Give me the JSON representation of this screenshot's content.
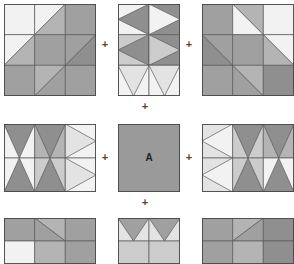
{
  "figure": {
    "background_color": "#ffffff",
    "outline_color": "#4a4a4a",
    "operator_symbol": "+",
    "operator_color": "#4a4a4a",
    "center_label": "A",
    "center_label_color": "#222222"
  },
  "palette": {
    "white": "#f7f7f7",
    "near_white": "#f2f2f2",
    "light": "#e3e3e3",
    "light_mid": "#cccccc",
    "mid": "#b4b4b4",
    "mid_dark": "#a0a0a0",
    "dark": "#8f8f8f",
    "darker": "#858585",
    "plain": "#9a9a9a",
    "stroke": "#5a5a5a"
  },
  "operators": [
    {
      "name": "plus-top-left-center",
      "symbol": "+",
      "x": 105,
      "y": 45
    },
    {
      "name": "plus-top-center-right",
      "symbol": "+",
      "x": 189,
      "y": 45
    },
    {
      "name": "plus-row1-row2",
      "symbol": "+",
      "x": 145,
      "y": 107
    },
    {
      "name": "plus-mid-left-center",
      "symbol": "+",
      "x": 105,
      "y": 158
    },
    {
      "name": "plus-mid-center-right",
      "symbol": "+",
      "x": 189,
      "y": 158
    },
    {
      "name": "plus-row2-row3",
      "symbol": "+",
      "x": 145,
      "y": 203
    }
  ],
  "blocks": [
    {
      "name": "block-top-left",
      "position": "top-left",
      "x": 4,
      "y": 4,
      "w": 92,
      "h": 92,
      "grid_cols": 3,
      "grid_rows": 3,
      "pattern": "diagonal-sash-descending",
      "cells": [
        {
          "r": 0,
          "c": 0,
          "type": "solid",
          "fill": "#f2f2f2"
        },
        {
          "r": 0,
          "c": 1,
          "type": "diag-tl-br",
          "fill_a": "#f2f2f2",
          "fill_b": "#b4b4b4"
        },
        {
          "r": 0,
          "c": 2,
          "type": "solid",
          "fill": "#a0a0a0"
        },
        {
          "r": 1,
          "c": 0,
          "type": "diag-tl-br",
          "fill_a": "#f2f2f2",
          "fill_b": "#b4b4b4"
        },
        {
          "r": 1,
          "c": 1,
          "type": "solid",
          "fill": "#a0a0a0"
        },
        {
          "r": 1,
          "c": 2,
          "type": "diag-tl-br",
          "fill_a": "#a0a0a0",
          "fill_b": "#8f8f8f"
        },
        {
          "r": 2,
          "c": 0,
          "type": "solid",
          "fill": "#a0a0a0"
        },
        {
          "r": 2,
          "c": 1,
          "type": "diag-tl-br",
          "fill_a": "#b4b4b4",
          "fill_b": "#a0a0a0"
        },
        {
          "r": 2,
          "c": 2,
          "type": "solid",
          "fill": "#a0a0a0"
        }
      ]
    },
    {
      "name": "block-top-center",
      "position": "top-center",
      "x": 118,
      "y": 4,
      "w": 62,
      "h": 92,
      "grid_cols": 2,
      "grid_rows": 3,
      "pattern": "hourglass-stack",
      "cells": [
        {
          "r": 0,
          "c": 0,
          "type": "tri-right",
          "fill_a": "#8f8f8f",
          "fill_b": "#f2f2f2"
        },
        {
          "r": 0,
          "c": 1,
          "type": "tri-left",
          "fill_a": "#f2f2f2",
          "fill_b": "#8f8f8f"
        },
        {
          "r": 1,
          "c": 0,
          "type": "tri-right",
          "fill_a": "#8f8f8f",
          "fill_b": "#cccccc"
        },
        {
          "r": 1,
          "c": 1,
          "type": "tri-left",
          "fill_a": "#cccccc",
          "fill_b": "#8f8f8f"
        },
        {
          "r": 2,
          "c": 0,
          "type": "tri-down",
          "fill_a": "#e3e3e3",
          "fill_b": "#f2f2f2"
        },
        {
          "r": 2,
          "c": 1,
          "type": "tri-down",
          "fill_a": "#e3e3e3",
          "fill_b": "#f2f2f2"
        }
      ]
    },
    {
      "name": "block-top-right",
      "position": "top-right",
      "x": 202,
      "y": 4,
      "w": 92,
      "h": 92,
      "grid_cols": 3,
      "grid_rows": 3,
      "pattern": "diagonal-sash-ascending",
      "cells": [
        {
          "r": 0,
          "c": 0,
          "type": "solid",
          "fill": "#a0a0a0"
        },
        {
          "r": 0,
          "c": 1,
          "type": "diag-bl-tr",
          "fill_a": "#f2f2f2",
          "fill_b": "#b4b4b4"
        },
        {
          "r": 0,
          "c": 2,
          "type": "solid",
          "fill": "#f2f2f2"
        },
        {
          "r": 1,
          "c": 0,
          "type": "diag-bl-tr",
          "fill_a": "#8f8f8f",
          "fill_b": "#a0a0a0"
        },
        {
          "r": 1,
          "c": 1,
          "type": "solid",
          "fill": "#a0a0a0"
        },
        {
          "r": 1,
          "c": 2,
          "type": "diag-bl-tr",
          "fill_a": "#b4b4b4",
          "fill_b": "#f2f2f2"
        },
        {
          "r": 2,
          "c": 0,
          "type": "solid",
          "fill": "#a0a0a0"
        },
        {
          "r": 2,
          "c": 1,
          "type": "diag-bl-tr",
          "fill_a": "#a0a0a0",
          "fill_b": "#b4b4b4"
        },
        {
          "r": 2,
          "c": 2,
          "type": "solid",
          "fill": "#8f8f8f"
        }
      ]
    },
    {
      "name": "block-middle-left",
      "position": "middle-left",
      "x": 4,
      "y": 124,
      "w": 92,
      "h": 68,
      "grid_cols": 3,
      "grid_rows": 2,
      "pattern": "hourglass-row",
      "cells": [
        {
          "r": 0,
          "c": 0,
          "type": "tri-down",
          "fill_a": "#8f8f8f",
          "fill_b": "#f2f2f2"
        },
        {
          "r": 0,
          "c": 1,
          "type": "tri-down",
          "fill_a": "#8f8f8f",
          "fill_b": "#b4b4b4"
        },
        {
          "r": 0,
          "c": 2,
          "type": "tri-left",
          "fill_a": "#e3e3e3",
          "fill_b": "#f2f2f2"
        },
        {
          "r": 1,
          "c": 0,
          "type": "tri-up",
          "fill_a": "#8f8f8f",
          "fill_b": "#f2f2f2"
        },
        {
          "r": 1,
          "c": 1,
          "type": "tri-up",
          "fill_a": "#8f8f8f",
          "fill_b": "#cccccc"
        },
        {
          "r": 1,
          "c": 2,
          "type": "tri-left",
          "fill_a": "#e3e3e3",
          "fill_b": "#f2f2f2"
        }
      ]
    },
    {
      "name": "block-center-plain",
      "position": "center",
      "x": 118,
      "y": 124,
      "w": 62,
      "h": 68,
      "grid_cols": 1,
      "grid_rows": 1,
      "pattern": "plain-labelled",
      "label": "A",
      "cells": [
        {
          "r": 0,
          "c": 0,
          "type": "solid",
          "fill": "#9a9a9a"
        }
      ]
    },
    {
      "name": "block-middle-right",
      "position": "middle-right",
      "x": 202,
      "y": 124,
      "w": 92,
      "h": 68,
      "grid_cols": 3,
      "grid_rows": 2,
      "pattern": "hourglass-row-mirrored",
      "cells": [
        {
          "r": 0,
          "c": 0,
          "type": "tri-right",
          "fill_a": "#f2f2f2",
          "fill_b": "#e3e3e3"
        },
        {
          "r": 0,
          "c": 1,
          "type": "tri-down",
          "fill_a": "#8f8f8f",
          "fill_b": "#cccccc"
        },
        {
          "r": 0,
          "c": 2,
          "type": "tri-down",
          "fill_a": "#8f8f8f",
          "fill_b": "#b4b4b4"
        },
        {
          "r": 1,
          "c": 0,
          "type": "tri-right",
          "fill_a": "#f2f2f2",
          "fill_b": "#e3e3e3"
        },
        {
          "r": 1,
          "c": 1,
          "type": "tri-up",
          "fill_a": "#8f8f8f",
          "fill_b": "#cccccc"
        },
        {
          "r": 1,
          "c": 2,
          "type": "tri-up",
          "fill_a": "#8f8f8f",
          "fill_b": "#f2f2f2"
        }
      ]
    },
    {
      "name": "block-bottom-left",
      "position": "bottom-left",
      "x": 4,
      "y": 218,
      "w": 92,
      "h": 46,
      "grid_cols": 3,
      "grid_rows": 2,
      "clipped": true,
      "pattern": "diagonal-sash-ascending-partial",
      "cells": [
        {
          "r": 0,
          "c": 0,
          "type": "solid",
          "fill": "#a0a0a0"
        },
        {
          "r": 0,
          "c": 1,
          "type": "diag-bl-tr",
          "fill_a": "#a0a0a0",
          "fill_b": "#b4b4b4"
        },
        {
          "r": 0,
          "c": 2,
          "type": "solid",
          "fill": "#a0a0a0"
        },
        {
          "r": 1,
          "c": 0,
          "type": "solid",
          "fill": "#f2f2f2"
        },
        {
          "r": 1,
          "c": 1,
          "type": "solid",
          "fill": "#b4b4b4"
        },
        {
          "r": 1,
          "c": 2,
          "type": "solid",
          "fill": "#a0a0a0"
        }
      ]
    },
    {
      "name": "block-bottom-center",
      "position": "bottom-center",
      "x": 118,
      "y": 218,
      "w": 62,
      "h": 46,
      "grid_cols": 2,
      "grid_rows": 2,
      "clipped": true,
      "pattern": "tri-down-pair-partial",
      "cells": [
        {
          "r": 0,
          "c": 0,
          "type": "tri-down",
          "fill_a": "#a0a0a0",
          "fill_b": "#e3e3e3"
        },
        {
          "r": 0,
          "c": 1,
          "type": "tri-down",
          "fill_a": "#a0a0a0",
          "fill_b": "#e3e3e3"
        },
        {
          "r": 1,
          "c": 0,
          "type": "solid",
          "fill": "#cccccc"
        },
        {
          "r": 1,
          "c": 1,
          "type": "solid",
          "fill": "#cccccc"
        }
      ]
    },
    {
      "name": "block-bottom-right",
      "position": "bottom-right",
      "x": 202,
      "y": 218,
      "w": 92,
      "h": 46,
      "grid_cols": 3,
      "grid_rows": 2,
      "clipped": true,
      "pattern": "diagonal-sash-descending-partial",
      "cells": [
        {
          "r": 0,
          "c": 0,
          "type": "solid",
          "fill": "#a0a0a0"
        },
        {
          "r": 0,
          "c": 1,
          "type": "diag-tl-br",
          "fill_a": "#b4b4b4",
          "fill_b": "#a0a0a0"
        },
        {
          "r": 0,
          "c": 2,
          "type": "solid",
          "fill": "#8f8f8f"
        },
        {
          "r": 1,
          "c": 0,
          "type": "solid",
          "fill": "#a0a0a0"
        },
        {
          "r": 1,
          "c": 1,
          "type": "solid",
          "fill": "#b4b4b4"
        },
        {
          "r": 1,
          "c": 2,
          "type": "solid",
          "fill": "#8f8f8f"
        }
      ]
    }
  ]
}
